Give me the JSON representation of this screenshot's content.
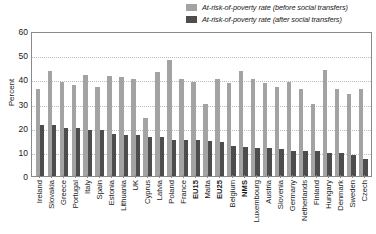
{
  "chart_data": {
    "type": "bar",
    "title": "",
    "xlabel": "",
    "ylabel": "Percent",
    "ylim": [
      0,
      60
    ],
    "yticks": [
      0,
      10,
      20,
      30,
      40,
      50,
      60
    ],
    "grid": true,
    "legend_position": "top-right",
    "categories": [
      "Ireland",
      "Slovakia",
      "Greece",
      "Portugal",
      "Italy",
      "Spain",
      "Estonia",
      "Lithuania",
      "UK",
      "Cyprus",
      "Latvia",
      "Poland",
      "France",
      "EU15",
      "Malta",
      "EU25",
      "Belgium",
      "NMS",
      "Luxembourg",
      "Austria",
      "Slovenia",
      "Germany",
      "Netherlands",
      "Finland",
      "Hungary",
      "Denmark",
      "Sweden",
      "Czech"
    ],
    "bold_categories": [
      "EU15",
      "EU25",
      "NMS"
    ],
    "series": [
      {
        "name": "At-risk-of-poverty rate (before social transfers)",
        "color": "#a3a3a3",
        "values": [
          36,
          43.5,
          39,
          37.5,
          42,
          37,
          41.5,
          41,
          40,
          24,
          43,
          48,
          40,
          39,
          30,
          40,
          38.5,
          43.5,
          40,
          38.5,
          37,
          39,
          36,
          30,
          44,
          36,
          34,
          36
        ]
      },
      {
        "name": "At-risk-of-poverty rate (after social transfers)",
        "color": "#4d4d4d",
        "values": [
          21,
          21,
          20,
          20,
          19,
          19,
          17.5,
          17,
          17,
          16,
          16,
          15,
          15,
          15,
          14.5,
          14,
          12.5,
          12,
          11.5,
          11.5,
          11,
          10.5,
          10.5,
          10.5,
          9.5,
          9.5,
          8.5,
          7
        ]
      }
    ]
  },
  "legend": {
    "items": [
      {
        "label": "At-risk-of-poverty rate (before social transfers)"
      },
      {
        "label": "At-risk-of-poverty rate (after social transfers)"
      }
    ]
  }
}
